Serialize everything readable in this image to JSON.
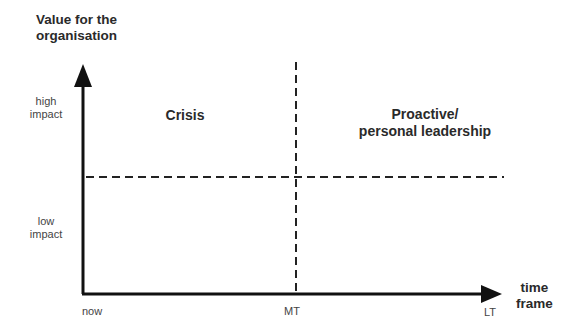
{
  "diagram": {
    "type": "quadrant-matrix",
    "y_axis": {
      "title_line1": "Value for the",
      "title_line2": "organisation",
      "levels": [
        {
          "line1": "high",
          "line2": "impact"
        },
        {
          "line1": "low",
          "line2": "impact"
        }
      ]
    },
    "x_axis": {
      "title_line1": "time",
      "title_line2": "frame",
      "ticks": [
        "now",
        "MT",
        "LT"
      ]
    },
    "quadrants": {
      "top_left": {
        "line1": "Crisis"
      },
      "top_right": {
        "line1": "Proactive/",
        "line2": "personal leadership"
      }
    },
    "colors": {
      "axis": "#111111",
      "dashed": "#222222",
      "text": "#2a2a2a"
    }
  }
}
